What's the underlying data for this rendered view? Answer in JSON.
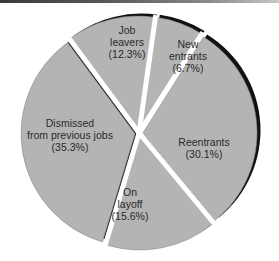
{
  "chart_data": {
    "type": "pie",
    "title": "",
    "start_angle_deg_clockwise_from_top": 8,
    "slices": [
      {
        "label": "New entrants",
        "label_lines": [
          "New",
          "entrants",
          "(6.7%)"
        ],
        "value": 6.7
      },
      {
        "label": "Reentrants",
        "label_lines": [
          "Reentrants",
          "(30.1%)"
        ],
        "value": 30.1
      },
      {
        "label": "On layoff",
        "label_lines": [
          "On",
          "layoff",
          "(15.6%)"
        ],
        "value": 15.6
      },
      {
        "label": "Dismissed from previous jobs",
        "label_lines": [
          "Dismissed",
          "from previous jobs",
          "(35.3%)"
        ],
        "value": 35.3
      },
      {
        "label": "Job leavers",
        "label_lines": [
          "Job",
          "leavers",
          "(12.3%)"
        ],
        "value": 12.3
      }
    ],
    "legend": "none",
    "grid": false
  },
  "style": {
    "slice_fill": "#b4b4b4",
    "shadow": "#111111",
    "gap": "#ffffff"
  }
}
